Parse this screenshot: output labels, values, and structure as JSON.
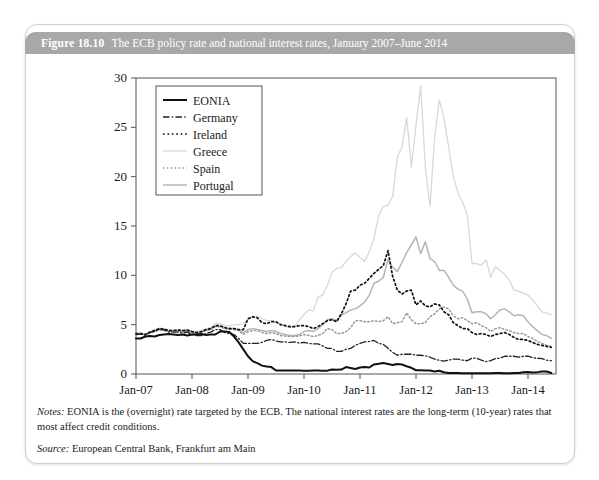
{
  "figure": {
    "number": "Figure 18.10",
    "title": "The ECB policy rate and national interest rates, January 2007–June 2014",
    "notes_label": "Notes:",
    "notes_text": "EONIA is the (overnight) rate targeted by the ECB. The national interest rates are the long-term (10-year) rates that most affect credit conditions.",
    "source_label": "Source:",
    "source_text": "European Central Bank, Frankfurt am Main"
  },
  "colors": {
    "header_bg": "#a8a8a8",
    "header_text": "#ffffff",
    "card_border": "#cfcfcf",
    "axis": "#555555",
    "eonia": "#111111",
    "germany": "#222222",
    "ireland": "#111111",
    "greece": "#d8d8d8",
    "spain": "#999999",
    "portugal": "#b5b5b5"
  },
  "chart_data": {
    "type": "line",
    "title": "The ECB policy rate and national interest rates, January 2007–June 2014",
    "xlabel": "",
    "ylabel": "",
    "ylim": [
      0,
      30
    ],
    "yticks": [
      0,
      5,
      10,
      15,
      20,
      25,
      30
    ],
    "xlim": [
      "2007-01",
      "2014-06"
    ],
    "xticks": [
      "Jan-07",
      "Jan-08",
      "Jan-09",
      "Jan-10",
      "Jan-11",
      "Jan-12",
      "Jan-13",
      "Jan-14"
    ],
    "xtick_values": [
      2007.0,
      2008.0,
      2009.0,
      2010.0,
      2011.0,
      2012.0,
      2013.0,
      2014.0
    ],
    "grid": false,
    "legend_position": "upper-left-inside",
    "x": [
      2007.0,
      2007.083,
      2007.167,
      2007.25,
      2007.333,
      2007.417,
      2007.5,
      2007.583,
      2007.667,
      2007.75,
      2007.833,
      2007.917,
      2008.0,
      2008.083,
      2008.167,
      2008.25,
      2008.333,
      2008.417,
      2008.5,
      2008.583,
      2008.667,
      2008.75,
      2008.833,
      2008.917,
      2009.0,
      2009.083,
      2009.167,
      2009.25,
      2009.333,
      2009.417,
      2009.5,
      2009.583,
      2009.667,
      2009.75,
      2009.833,
      2009.917,
      2010.0,
      2010.083,
      2010.167,
      2010.25,
      2010.333,
      2010.417,
      2010.5,
      2010.583,
      2010.667,
      2010.75,
      2010.833,
      2010.917,
      2011.0,
      2011.083,
      2011.167,
      2011.25,
      2011.333,
      2011.417,
      2011.5,
      2011.583,
      2011.667,
      2011.75,
      2011.833,
      2011.917,
      2012.0,
      2012.083,
      2012.167,
      2012.25,
      2012.333,
      2012.417,
      2012.5,
      2012.583,
      2012.667,
      2012.75,
      2012.833,
      2012.917,
      2013.0,
      2013.083,
      2013.167,
      2013.25,
      2013.333,
      2013.417,
      2013.5,
      2013.583,
      2013.667,
      2013.75,
      2013.833,
      2013.917,
      2014.0,
      2014.083,
      2014.167,
      2014.25,
      2014.333,
      2014.417
    ],
    "series": [
      {
        "name": "EONIA",
        "style": "solid",
        "color": "#111111",
        "width": 2.0,
        "values": [
          3.6,
          3.6,
          3.8,
          3.85,
          3.8,
          3.95,
          4.0,
          4.05,
          4.0,
          3.95,
          4.0,
          3.9,
          4.0,
          4.0,
          4.05,
          3.95,
          4.0,
          4.0,
          4.3,
          4.3,
          4.25,
          3.8,
          3.2,
          2.5,
          1.8,
          1.3,
          1.1,
          0.85,
          0.75,
          0.7,
          0.35,
          0.35,
          0.35,
          0.35,
          0.35,
          0.35,
          0.34,
          0.34,
          0.35,
          0.35,
          0.34,
          0.34,
          0.45,
          0.43,
          0.45,
          0.7,
          0.6,
          0.5,
          0.66,
          0.71,
          0.66,
          0.97,
          1.03,
          1.12,
          1.01,
          0.91,
          1.01,
          0.96,
          0.79,
          0.63,
          0.38,
          0.37,
          0.36,
          0.35,
          0.25,
          0.33,
          0.18,
          0.11,
          0.1,
          0.09,
          0.08,
          0.07,
          0.07,
          0.07,
          0.07,
          0.08,
          0.08,
          0.09,
          0.09,
          0.08,
          0.08,
          0.09,
          0.1,
          0.17,
          0.2,
          0.16,
          0.19,
          0.25,
          0.26,
          0.1
        ]
      },
      {
        "name": "Germany",
        "style": "dashdot",
        "color": "#222222",
        "width": 1.3,
        "values": [
          4.0,
          4.05,
          3.95,
          4.2,
          4.3,
          4.5,
          4.45,
          4.25,
          4.25,
          4.25,
          4.15,
          4.25,
          4.0,
          3.9,
          3.9,
          4.1,
          4.25,
          4.5,
          4.5,
          4.2,
          4.1,
          4.0,
          3.6,
          3.1,
          3.1,
          3.1,
          3.1,
          3.2,
          3.4,
          3.5,
          3.35,
          3.25,
          3.25,
          3.2,
          3.25,
          3.15,
          3.2,
          3.1,
          3.05,
          3.05,
          2.85,
          2.6,
          2.6,
          2.3,
          2.3,
          2.5,
          2.6,
          2.9,
          3.1,
          3.25,
          3.3,
          3.4,
          3.1,
          3.0,
          2.6,
          2.2,
          1.9,
          2.0,
          2.0,
          2.0,
          1.9,
          1.9,
          1.85,
          1.7,
          1.5,
          1.4,
          1.3,
          1.4,
          1.5,
          1.5,
          1.4,
          1.35,
          1.6,
          1.6,
          1.4,
          1.25,
          1.35,
          1.55,
          1.6,
          1.8,
          1.8,
          1.8,
          1.7,
          1.8,
          1.8,
          1.65,
          1.6,
          1.55,
          1.4,
          1.35
        ]
      },
      {
        "name": "Ireland",
        "style": "dotted",
        "color": "#111111",
        "width": 1.7,
        "values": [
          4.1,
          4.1,
          4.0,
          4.25,
          4.4,
          4.6,
          4.55,
          4.4,
          4.4,
          4.45,
          4.4,
          4.45,
          4.3,
          4.2,
          4.3,
          4.5,
          4.6,
          4.9,
          4.9,
          4.7,
          4.6,
          4.6,
          4.5,
          4.5,
          5.6,
          5.8,
          5.7,
          5.2,
          5.1,
          5.3,
          5.3,
          5.0,
          4.9,
          4.8,
          4.8,
          4.9,
          4.9,
          4.8,
          4.6,
          4.8,
          5.1,
          5.4,
          5.5,
          5.3,
          6.1,
          7.1,
          8.4,
          8.5,
          9.0,
          9.2,
          9.7,
          10.2,
          10.6,
          11.0,
          12.5,
          9.9,
          8.5,
          8.1,
          8.4,
          8.5,
          7.0,
          7.4,
          6.9,
          6.8,
          7.1,
          7.0,
          6.3,
          6.0,
          5.2,
          4.9,
          4.6,
          4.6,
          4.2,
          4.0,
          4.1,
          4.0,
          3.8,
          4.0,
          4.1,
          4.2,
          4.0,
          3.7,
          3.5,
          3.5,
          3.4,
          3.2,
          3.0,
          2.9,
          2.8,
          2.7
        ]
      },
      {
        "name": "Greece",
        "style": "solid",
        "color": "#d8d8d8",
        "width": 1.3,
        "values": [
          4.15,
          4.15,
          4.1,
          4.3,
          4.45,
          4.65,
          4.6,
          4.45,
          4.45,
          4.5,
          4.45,
          4.5,
          4.4,
          4.3,
          4.4,
          4.6,
          4.7,
          5.1,
          5.1,
          4.9,
          4.85,
          5.0,
          5.0,
          5.1,
          5.6,
          5.7,
          5.9,
          5.6,
          5.4,
          5.4,
          5.2,
          5.0,
          4.8,
          4.7,
          4.8,
          5.5,
          6.0,
          6.5,
          6.4,
          7.8,
          8.0,
          9.0,
          10.3,
          10.7,
          10.8,
          11.4,
          11.9,
          12.3,
          11.8,
          11.4,
          12.4,
          13.8,
          16.0,
          17.0,
          17.1,
          18.0,
          22.0,
          23.0,
          26.0,
          21.0,
          25.2,
          29.2,
          21.0,
          17.0,
          24.0,
          27.8,
          25.9,
          23.0,
          20.0,
          18.3,
          17.4,
          16.1,
          11.2,
          11.2,
          11.0,
          11.6,
          9.8,
          10.9,
          10.5,
          10.1,
          9.5,
          8.5,
          8.4,
          8.2,
          8.0,
          7.5,
          6.9,
          6.3,
          6.2,
          6.0
        ]
      },
      {
        "name": "Spain",
        "style": "dotted",
        "color": "#999999",
        "width": 1.5,
        "values": [
          4.05,
          4.05,
          3.95,
          4.2,
          4.35,
          4.55,
          4.5,
          4.35,
          4.35,
          4.35,
          4.3,
          4.35,
          4.2,
          4.1,
          4.2,
          4.4,
          4.5,
          4.8,
          4.8,
          4.6,
          4.55,
          4.5,
          4.4,
          4.0,
          4.3,
          4.4,
          4.4,
          4.2,
          4.1,
          4.2,
          4.1,
          3.9,
          3.85,
          3.8,
          3.8,
          3.85,
          4.0,
          3.9,
          3.8,
          3.9,
          4.1,
          4.6,
          4.5,
          4.1,
          4.1,
          4.3,
          4.7,
          5.4,
          5.4,
          5.3,
          5.3,
          5.4,
          5.3,
          5.4,
          5.8,
          5.1,
          5.2,
          5.3,
          6.2,
          5.5,
          5.1,
          5.1,
          5.2,
          5.8,
          6.1,
          6.6,
          6.8,
          6.6,
          5.9,
          5.6,
          5.7,
          5.4,
          5.1,
          5.2,
          4.9,
          4.7,
          4.3,
          4.6,
          4.7,
          4.5,
          4.4,
          4.2,
          4.1,
          4.1,
          3.8,
          3.6,
          3.3,
          3.1,
          2.9,
          2.8
        ]
      },
      {
        "name": "Portugal",
        "style": "solid",
        "color": "#b5b5b5",
        "width": 1.5,
        "values": [
          4.1,
          4.1,
          4.0,
          4.25,
          4.4,
          4.6,
          4.55,
          4.4,
          4.4,
          4.4,
          4.35,
          4.4,
          4.25,
          4.15,
          4.25,
          4.45,
          4.55,
          4.85,
          4.85,
          4.65,
          4.6,
          4.6,
          4.5,
          4.2,
          4.5,
          4.6,
          4.5,
          4.4,
          4.3,
          4.4,
          4.3,
          4.1,
          4.0,
          3.9,
          3.9,
          4.0,
          4.3,
          4.4,
          4.3,
          4.6,
          5.0,
          5.5,
          5.6,
          5.4,
          6.0,
          6.2,
          6.5,
          6.6,
          6.9,
          7.3,
          8.0,
          9.2,
          9.4,
          9.8,
          11.6,
          10.8,
          10.4,
          11.3,
          12.3,
          13.1,
          13.9,
          12.2,
          13.4,
          11.7,
          11.4,
          10.5,
          10.5,
          9.8,
          9.0,
          8.6,
          8.4,
          7.6,
          6.2,
          6.3,
          6.3,
          6.1,
          5.6,
          6.0,
          6.5,
          6.6,
          6.3,
          5.9,
          6.0,
          5.9,
          5.3,
          4.8,
          4.4,
          4.0,
          3.9,
          3.6
        ]
      }
    ]
  },
  "legend": {
    "items": [
      {
        "label": "EONIA",
        "style": "solid",
        "color": "#111111"
      },
      {
        "label": "Germany",
        "style": "dashdot",
        "color": "#222222"
      },
      {
        "label": "Ireland",
        "style": "dotted",
        "color": "#111111"
      },
      {
        "label": "Greece",
        "style": "solid",
        "color": "#d8d8d8"
      },
      {
        "label": "Spain",
        "style": "dotted",
        "color": "#999999"
      },
      {
        "label": "Portugal",
        "style": "solid",
        "color": "#b5b5b5"
      }
    ]
  }
}
